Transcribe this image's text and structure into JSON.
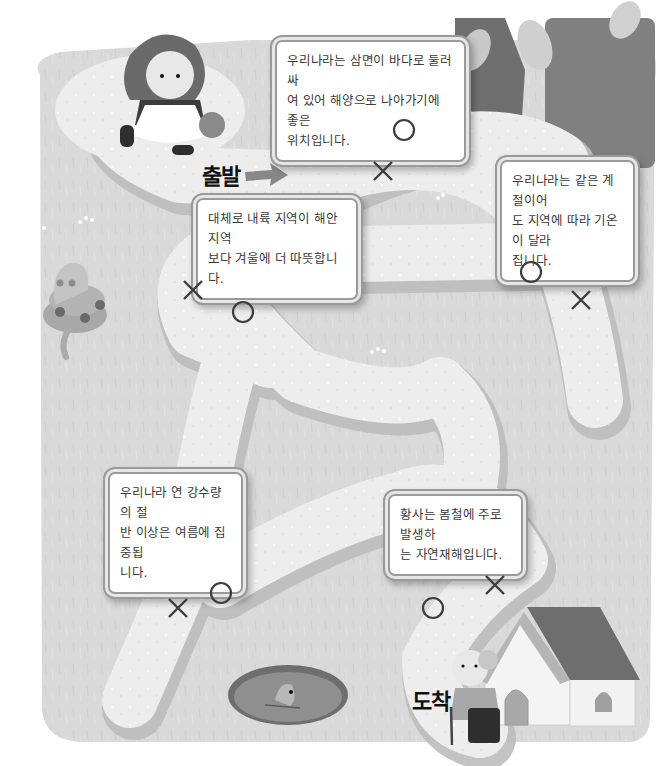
{
  "colors": {
    "grass": "#d9d9d9",
    "path": "#eeeeee",
    "path_shadow": "#bdbdbd",
    "tree": "#7a7a7a",
    "sign_border": "#9a9a9a",
    "mark": "#3d3d3d"
  },
  "labels": {
    "start": "출발",
    "finish": "도착"
  },
  "signs": [
    {
      "id": "sign-1",
      "lines": [
        "우리나라는 삼면이 바다로 둘러싸",
        "여 있어 해양으로 나아가기에 좋은",
        "위치입니다."
      ],
      "o_mark": "circle",
      "x_mark": "cross"
    },
    {
      "id": "sign-2",
      "lines": [
        "대체로 내륙 지역이 해안 지역",
        "보다 겨울에 더 따뜻합니다."
      ],
      "o_mark": "circle",
      "x_mark": "cross"
    },
    {
      "id": "sign-3",
      "lines": [
        "우리나라는 같은 계절이어",
        "도 지역에 따라 기온이 달라",
        "집니다."
      ],
      "o_mark": "circle",
      "x_mark": "cross"
    },
    {
      "id": "sign-4",
      "lines": [
        "우리나라 연 강수량의 절",
        "반 이상은 여름에 집중됩",
        "니다."
      ],
      "o_mark": "circle",
      "x_mark": "cross"
    },
    {
      "id": "sign-5",
      "lines": [
        "황사는 봄철에 주로 발생하",
        "는 자연재해입니다."
      ],
      "o_mark": "circle",
      "x_mark": "cross"
    }
  ],
  "icons": {
    "girl": "girl-with-basket-icon",
    "grandma": "grandmother-icon",
    "house": "house-icon",
    "snake": "snake-icon",
    "pond": "pond-with-fish-icon",
    "tree": "tree-icon",
    "arrow": "arrow-right-icon",
    "o": "circle-mark-icon",
    "x": "cross-mark-icon"
  }
}
